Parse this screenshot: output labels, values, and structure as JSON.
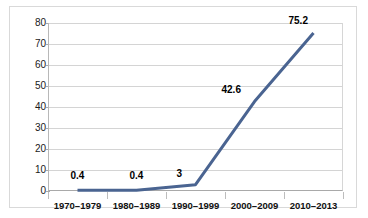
{
  "chart_data": {
    "type": "line",
    "title": "",
    "xlabel": "",
    "ylabel": "",
    "categories": [
      "1970–1979",
      "1980–1989",
      "1990–1999",
      "2000–2009",
      "2010–2013"
    ],
    "values": [
      0.4,
      0.4,
      3,
      42.6,
      75.2
    ],
    "data_labels": [
      "0.4",
      "0.4",
      "3",
      "42.6",
      "75.2"
    ],
    "yticks": [
      0,
      10,
      20,
      30,
      40,
      50,
      60,
      70,
      80
    ],
    "ytick_labels": [
      "0",
      "10",
      "20",
      "30",
      "40",
      "50",
      "60",
      "70",
      "80"
    ],
    "ylim": [
      0,
      80
    ],
    "grid": "horizontal",
    "legend": "none",
    "series_color": "#4a6491",
    "gridline_color": "#d4d4d4",
    "axis_color": "#a9a9a9",
    "label_color": "#111111"
  }
}
